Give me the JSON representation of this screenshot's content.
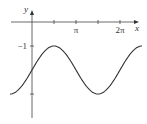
{
  "chart_data": {
    "type": "line",
    "title": "",
    "function": "y = sin(x) - 2",
    "xlabel": "x",
    "ylabel": "y",
    "xlim": [
      -1.5708,
      7.854
    ],
    "ylim": [
      -4,
      0.4
    ],
    "x_ticks": [
      {
        "value": 1.5708,
        "label": ""
      },
      {
        "value": 3.14159,
        "label": "π"
      },
      {
        "value": 4.7124,
        "label": ""
      },
      {
        "value": 6.28318,
        "label": "2π"
      }
    ],
    "y_ticks": [
      {
        "value": -1,
        "label": "−1"
      },
      {
        "value": -3,
        "label": ""
      }
    ],
    "series": [
      {
        "name": "y = sin(x) - 2",
        "color": "#333333",
        "x_range": [
          -1.5708,
          7.854
        ],
        "samples": 120
      }
    ],
    "grid": false,
    "legend": "none"
  }
}
